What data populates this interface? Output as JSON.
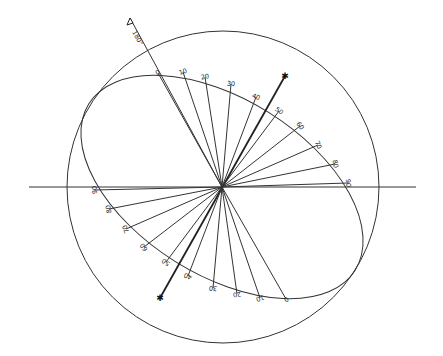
{
  "diagram": {
    "type": "polarization-ellipse-construction",
    "hub": {
      "x": 222,
      "y": 187
    },
    "circle": {
      "cx": 223,
      "cy": 187,
      "r": 156
    },
    "ellipse": {
      "cx": 222,
      "cy": 187,
      "rx": 157,
      "ry": 88,
      "rotation_deg": 32
    },
    "horizontal_axis": {
      "x1": 29,
      "x2": 416,
      "y": 187
    },
    "arrow_axis": {
      "label": "180°",
      "from": {
        "x": 222,
        "y": 187
      },
      "to": {
        "x": 130,
        "y": 18
      }
    },
    "special_axis": {
      "from": {
        "x": 160,
        "y": 298
      },
      "to": {
        "x": 285,
        "y": 76
      },
      "marker": "asterisk"
    },
    "upper_labels": [
      {
        "text": "0",
        "x": 158,
        "y": 73
      },
      {
        "text": "10",
        "x": 183,
        "y": 72
      },
      {
        "text": "20",
        "x": 205,
        "y": 77
      },
      {
        "text": "30",
        "x": 231,
        "y": 84
      },
      {
        "text": "40",
        "x": 256,
        "y": 97
      },
      {
        "text": "50",
        "x": 279,
        "y": 111
      },
      {
        "text": "60",
        "x": 300,
        "y": 126
      },
      {
        "text": "70",
        "x": 318,
        "y": 145
      },
      {
        "text": "80",
        "x": 335,
        "y": 164
      },
      {
        "text": "90",
        "x": 348,
        "y": 183
      }
    ],
    "lower_labels": [
      {
        "text": "0",
        "x": 286,
        "y": 299
      },
      {
        "text": "10",
        "x": 260,
        "y": 298
      },
      {
        "text": "20",
        "x": 237,
        "y": 294
      },
      {
        "text": "30",
        "x": 213,
        "y": 288
      },
      {
        "text": "40",
        "x": 188,
        "y": 276
      },
      {
        "text": "50",
        "x": 166,
        "y": 262
      },
      {
        "text": "60",
        "x": 144,
        "y": 247
      },
      {
        "text": "70",
        "x": 126,
        "y": 229
      },
      {
        "text": "80",
        "x": 109,
        "y": 209
      },
      {
        "text": "90",
        "x": 95,
        "y": 190
      }
    ]
  }
}
